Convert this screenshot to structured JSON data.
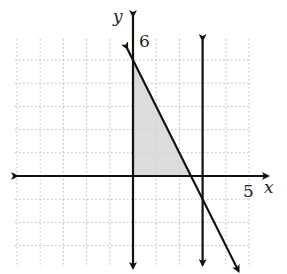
{
  "chart_data": {
    "type": "line",
    "title": "",
    "xlabel": "x",
    "ylabel": "y",
    "tick_labels": {
      "x": "5",
      "y": "6"
    },
    "xlim": [
      -5.5,
      5
    ],
    "ylim": [
      -4,
      6
    ],
    "grid": true,
    "lines": [
      {
        "name": "x = 0 (boundary)",
        "type": "vertical",
        "x": 0
      },
      {
        "name": "x = 3",
        "type": "vertical",
        "x": 3
      },
      {
        "name": "2x + y = 5",
        "slope": -2,
        "intercept": 5
      }
    ],
    "shaded_region": {
      "description": "x >= 0, y >= 0, 2x + y <= 5",
      "vertices": [
        [
          0,
          0
        ],
        [
          2.5,
          0
        ],
        [
          0,
          5
        ]
      ],
      "color": "#d8d8d8"
    }
  },
  "labels": {
    "x_axis": "x",
    "y_axis": "y",
    "x_tick": "5",
    "y_tick": "6"
  }
}
